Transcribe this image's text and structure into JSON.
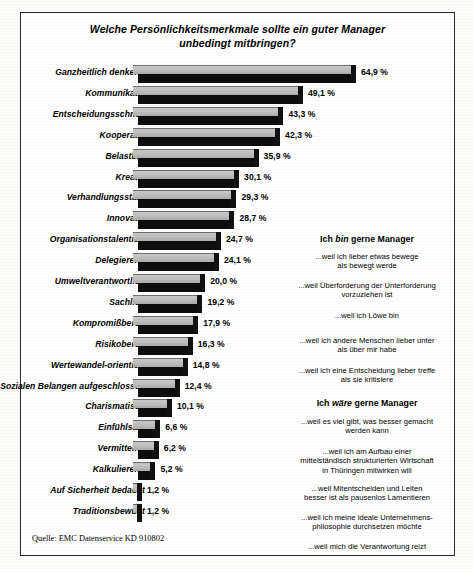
{
  "title": {
    "line1": "Welche Persönlichkeitsmerkmale sollte ein guter Manager",
    "line2": "unbedingt mitbringen?"
  },
  "source": "Quelle: EMC Datenservice KD 910802",
  "annotations": {
    "head_bin": {
      "pre": "Ich ",
      "em": "bin",
      "post": " gerne Manager"
    },
    "head_waere": {
      "pre": "Ich ",
      "em": "wäre",
      "post": " gerne Manager"
    },
    "bin_1": "...weil ich lieber etwas bewege\nals bewegt werde",
    "bin_2": "...weil Überforderung der Unterforderung\nvorzuziehen ist",
    "bin_3": "...weil ich Löwe bin",
    "bin_4": "...weil ich andere Menschen lieber unter\nals über mir habe",
    "bin_5": "...weil ich eine Entscheidung lieber treffe\nals sie kritisiere",
    "waere_1": "...weil es viel gibt, was besser gemacht\nwerden kann",
    "waere_2": "...weil ich am Aufbau einer\nmittelständisch strukturierten Wirtschaft\nin Thüringen mitwirken will",
    "waere_3": "...weil Mitentscheiden und Leiten\nbesser ist als pausenlos Lamentieren",
    "waere_4": "...weil ich meine ideale Unternehmens-\nphilosophie durchsetzen möchte",
    "waere_5": "...weil mich die Verantwortung reizt"
  },
  "chart_data": {
    "type": "bar",
    "orientation": "horizontal",
    "title": "Welche Persönlichkeitsmerkmale sollte ein guter Manager unbedingt mitbringen?",
    "xlabel": "",
    "ylabel": "",
    "unit": "%",
    "xlim": [
      0,
      64.9
    ],
    "grid": false,
    "legend": false,
    "categories": [
      "Ganzheitlich denkend",
      "Kommunikativ",
      "Entscheidungsschnell",
      "Kooperativ",
      "Belastbar",
      "Kreativ",
      "Verhandlungsstark",
      "Innovativ",
      "Organisationstalentiert",
      "Delegierend",
      "Umweltverantwortlich",
      "Sachlich",
      "Kompromißbereit",
      "Risikobereit",
      "Wertewandel-orientiert",
      "Sozialen Belangen aufgeschlossen",
      "Charismatisch",
      "Einfühlsam",
      "Vermittelnd",
      "Kalkulierend",
      "Auf Sicherheit bedacht",
      "Traditionsbewußt"
    ],
    "values": [
      64.9,
      49.1,
      43.3,
      42.3,
      35.9,
      30.1,
      29.3,
      28.7,
      24.7,
      24.1,
      20.0,
      19.2,
      17.9,
      16.3,
      14.8,
      12.4,
      10.1,
      6.6,
      6.2,
      5.2,
      1.2,
      1.2
    ],
    "value_labels": [
      "64,9 %",
      "49,1 %",
      "43,3 %",
      "42,3 %",
      "35,9 %",
      "30,1 %",
      "29,3 %",
      "28,7 %",
      "24,7 %",
      "24,1 %",
      "20,0 %",
      "19,2 %",
      "17,9 %",
      "16,3 %",
      "14,8 %",
      "12,4 %",
      "10,1 %",
      "6,6 %",
      "6,2 %",
      "5,2 %",
      "1,2 %",
      "1,2 %"
    ]
  }
}
